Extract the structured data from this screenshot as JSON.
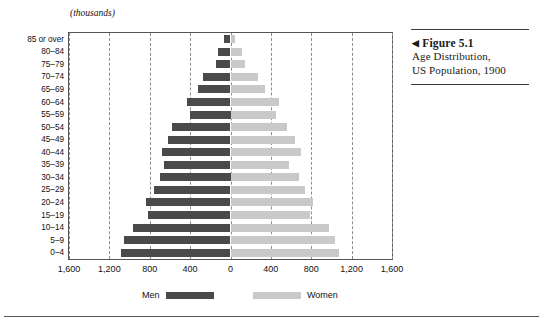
{
  "figure": {
    "marker": "◀",
    "title": "Figure 5.1",
    "line1": "Age Distribution,",
    "line2": "US Population, 1900"
  },
  "chart": {
    "units_label": "(thousands)",
    "legend": {
      "men": "Men",
      "women": "Women"
    },
    "colors": {
      "men": "#4a4a4a",
      "women": "#c9c9c9",
      "grid": "#8c8c8c",
      "border": "#555555"
    }
  },
  "chart_data": {
    "type": "bar",
    "subtype": "population-pyramid",
    "title": "Age Distribution, US Population, 1900",
    "xlabel": "",
    "ylabel": "",
    "units": "thousands",
    "grid": true,
    "legend_position": "bottom",
    "xlim": [
      -1600,
      1600
    ],
    "xticks": [
      1600,
      1200,
      800,
      400,
      0,
      400,
      800,
      1200,
      1600
    ],
    "xtick_labels": [
      "1,600",
      "1,200",
      "800",
      "400",
      "0",
      "400",
      "800",
      "1,200",
      "1,600"
    ],
    "categories": [
      "85 or over",
      "80–84",
      "75–79",
      "70–74",
      "65–69",
      "60–64",
      "55–59",
      "50–54",
      "45–49",
      "40–44",
      "35–39",
      "30–34",
      "25–29",
      "20–24",
      "15–19",
      "10–14",
      "5–9",
      "0–4"
    ],
    "series": [
      {
        "name": "Men",
        "side": "left",
        "color": "#4a4a4a",
        "values": [
          60,
          125,
          140,
          270,
          320,
          435,
          400,
          580,
          620,
          680,
          660,
          700,
          760,
          840,
          820,
          970,
          1060,
          1080
        ]
      },
      {
        "name": "Women",
        "side": "right",
        "color": "#c9c9c9",
        "values": [
          45,
          110,
          140,
          270,
          340,
          480,
          450,
          560,
          640,
          700,
          580,
          680,
          740,
          820,
          790,
          980,
          1040,
          1070
        ]
      }
    ]
  }
}
